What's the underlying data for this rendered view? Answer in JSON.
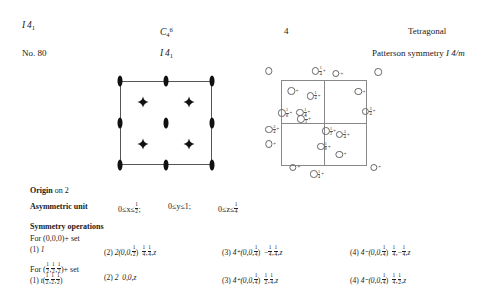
{
  "header": {
    "hm_symbol_letter": "I",
    "hm_symbol_num": "4",
    "hm_symbol_sub": "1",
    "schoenflies_letter": "C",
    "schoenflies_sub": "4",
    "schoenflies_sup": "6",
    "point_group": "4",
    "crystal_system": "Tetragonal",
    "number_label": "No. 80",
    "full_symbol_letter": "I",
    "full_symbol_num": "4",
    "full_symbol_sub": "1",
    "patterson_label": "Patterson symmetry",
    "patterson_symbol": "I 4/m"
  },
  "diagrams": {
    "symmetry_diagram": {
      "name": "symmetry-element-diagram",
      "twofold_axes": [
        {
          "x": 0,
          "y": 0
        },
        {
          "x": 50,
          "y": 0
        },
        {
          "x": 100,
          "y": 0
        },
        {
          "x": 0,
          "y": 50
        },
        {
          "x": 50,
          "y": 50
        },
        {
          "x": 100,
          "y": 50
        },
        {
          "x": 0,
          "y": 100
        },
        {
          "x": 50,
          "y": 100
        },
        {
          "x": 100,
          "y": 100
        }
      ],
      "screw_axes_4_1": [
        {
          "x": 25,
          "y": 25
        },
        {
          "x": 75,
          "y": 25
        },
        {
          "x": 25,
          "y": 75
        },
        {
          "x": 75,
          "y": 75
        }
      ]
    },
    "general_position_diagram": {
      "name": "general-position-diagram",
      "points": [
        {
          "x": -14,
          "y": -12,
          "label": ""
        },
        {
          "x": 44,
          "y": -12,
          "frac_n": "1",
          "frac_d": "4",
          "label": "+"
        },
        {
          "x": 66,
          "y": -9,
          "label": "+"
        },
        {
          "x": 113,
          "y": -11,
          "label": ""
        },
        {
          "x": 14,
          "y": 11,
          "label": "+"
        },
        {
          "x": 38,
          "y": 17,
          "frac_n": "1",
          "frac_d": "4",
          "label": "+"
        },
        {
          "x": 92,
          "y": 12,
          "label": "+"
        },
        {
          "x": 5,
          "y": 37,
          "frac_n": "1",
          "frac_d": "8",
          "label": "+"
        },
        {
          "x": 26,
          "y": 36,
          "frac_n": "1",
          "frac_d": "4",
          "label": "+"
        },
        {
          "x": 27,
          "y": 44,
          "frac_n": "1",
          "frac_d": "2",
          "label": "+"
        },
        {
          "x": 102,
          "y": 35,
          "frac_n": "3",
          "frac_d": "4",
          "label": "+"
        },
        {
          "x": -10,
          "y": 56,
          "frac_n": "3",
          "frac_d": "4",
          "label": "+"
        },
        {
          "x": -12,
          "y": 73,
          "label": "+"
        },
        {
          "x": 56,
          "y": 58,
          "frac_n": "1",
          "frac_d": "2",
          "label": "+"
        },
        {
          "x": 72,
          "y": 62,
          "frac_n": "3",
          "frac_d": "4",
          "label": "+"
        },
        {
          "x": 50,
          "y": 76,
          "frac_n": "1",
          "frac_d": "8",
          "label": "+"
        },
        {
          "x": 70,
          "y": 85,
          "label": "+"
        },
        {
          "x": 16,
          "y": 100,
          "label": "+"
        },
        {
          "x": 42,
          "y": 108,
          "frac_n": "1",
          "frac_d": "4",
          "label": "+"
        },
        {
          "x": 110,
          "y": 100,
          "label": "+"
        }
      ]
    }
  },
  "origin": {
    "label": "Origin",
    "text": "on 2"
  },
  "asymmetric_unit": {
    "label": "Asymmetric unit",
    "x_range_pre": "0≤x≤",
    "x_range_n": "1",
    "x_range_d": "2",
    "x_sep": ";",
    "y_range": "0≤y≤1;",
    "z_range_pre": "0≤z≤",
    "z_range_n": "1",
    "z_range_d": "4"
  },
  "symmetry_operations": {
    "title": "Symmetry operations",
    "set1_label": "For (0,0,0)+ set",
    "set2_label_pre": "For (",
    "set2_f1n": "1",
    "set2_f1d": "2",
    "set2_f2n": "1",
    "set2_f2d": "2",
    "set2_f3n": "1",
    "set2_f3d": "2",
    "set2_label_post": ")+ set",
    "set1": [
      {
        "num": "(1)",
        "op": "1",
        "coords": ""
      },
      {
        "num": "(2)",
        "op": "2(0,0,",
        "op_fn": "1",
        "op_fd": "2",
        "op_close": ")",
        "c1n": "1",
        "c1d": "4",
        "c2n": "1",
        "c2d": "4",
        "c3": "z"
      },
      {
        "num": "(3)",
        "op": "4⁺(0,0,",
        "op_fn": "1",
        "op_fd": "4",
        "op_close": ")",
        "cm1": "−",
        "c1n": "1",
        "c1d": "4",
        "c2n": "1",
        "c2d": "4",
        "c3": "z"
      },
      {
        "num": "(4)",
        "op": "4⁻(0,0,",
        "op_fn": "1",
        "op_fd": "4",
        "op_close": ")",
        "c1n": "1",
        "c1d": "4",
        "cm2": "−",
        "c2n": "1",
        "c2d": "4",
        "c3": "z"
      }
    ],
    "set2": [
      {
        "num": "(1)",
        "op": "t(",
        "f1n": "1",
        "f1d": "2",
        "f2n": "1",
        "f2d": "2",
        "f3n": "1",
        "f3d": "2",
        "op_close": ")"
      },
      {
        "num": "(2)",
        "op": "2",
        "coords": "0,0,z"
      },
      {
        "num": "(3)",
        "op": "4⁺(0,0,",
        "op_fn": "1",
        "op_fd": "4",
        "op_close": ")",
        "c1n": "1",
        "c1d": "2",
        "c2n": "1",
        "c2d": "4",
        "c3": "z"
      },
      {
        "num": "(4)",
        "op": "4⁻(0,0,",
        "op_fn": "1",
        "op_fd": "4",
        "op_close": ")",
        "c1n": "1",
        "c1d": "4",
        "c2n": "1",
        "c2d": "2",
        "c3": "z"
      }
    ]
  }
}
